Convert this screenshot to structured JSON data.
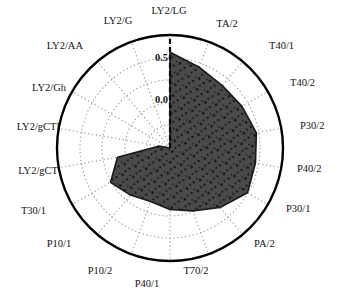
{
  "chart_data": {
    "type": "radar",
    "title": "",
    "subtitle": "",
    "xlabel": "",
    "ylabel": "",
    "grid": true,
    "legend": "none",
    "rlim": [
      -0.5,
      0.75
    ],
    "r_ticks": [
      {
        "value": 0.5,
        "label": "0.5"
      },
      {
        "value": 0.0,
        "label": "0.0"
      },
      {
        "value": -0.5,
        "label": "-0.5"
      }
    ],
    "tick_label_visible": [
      "0.5",
      "0.0"
    ],
    "outer_ring_value": 0.75,
    "start_angle_deg": 90,
    "direction": "clockwise",
    "categories": [
      "LY2/LG",
      "TA/2",
      "T40/1",
      "T40/2",
      "P30/2",
      "P40/2",
      "P30/1",
      "PA/2",
      "T70/2",
      "P40/1",
      "P10/2",
      "P10/1",
      "T30/1",
      "LY2/gCT",
      "LY2/gCTI",
      "LY2/Gh",
      "LY2/AA",
      "LY2/G"
    ],
    "series": [
      {
        "name": "series-1",
        "fill_color": "#4a4a4a",
        "line_color": "#1a1a1a",
        "values": [
          0.56,
          0.45,
          0.4,
          0.42,
          0.47,
          0.46,
          0.49,
          0.36,
          0.24,
          0.18,
          0.13,
          0.18,
          0.26,
          0.09,
          -0.38,
          -0.5,
          -0.5,
          -0.5
        ]
      }
    ]
  },
  "axes": [
    {
      "id": "axis-ly2-lg",
      "label": "LY2/LG",
      "lx": 169,
      "ly": 12,
      "anchor": "middle"
    },
    {
      "id": "axis-ta-2",
      "label": "TA/2",
      "lx": 227,
      "ly": 25,
      "anchor": "middle"
    },
    {
      "id": "axis-t40-1",
      "label": "T40/1",
      "lx": 269,
      "ly": 47,
      "anchor": "start"
    },
    {
      "id": "axis-t40-2",
      "label": "T40/2",
      "lx": 290,
      "ly": 84,
      "anchor": "start"
    },
    {
      "id": "axis-p30-2",
      "label": "P30/2",
      "lx": 300,
      "ly": 127,
      "anchor": "start"
    },
    {
      "id": "axis-p40-2",
      "label": "P40/2",
      "lx": 297,
      "ly": 170,
      "anchor": "start"
    },
    {
      "id": "axis-p30-1",
      "label": "P30/1",
      "lx": 286,
      "ly": 210,
      "anchor": "start"
    },
    {
      "id": "axis-pa-2",
      "label": "PA/2",
      "lx": 254,
      "ly": 245,
      "anchor": "start"
    },
    {
      "id": "axis-t70-2",
      "label": "T70/2",
      "lx": 196,
      "ly": 272,
      "anchor": "middle"
    },
    {
      "id": "axis-p40-1",
      "label": "P40/1",
      "lx": 147,
      "ly": 285,
      "anchor": "middle"
    },
    {
      "id": "axis-p10-2",
      "label": "P10/2",
      "lx": 100,
      "ly": 272,
      "anchor": "middle"
    },
    {
      "id": "axis-p10-1",
      "label": "P10/1",
      "lx": 59,
      "ly": 245,
      "anchor": "middle"
    },
    {
      "id": "axis-t30-1",
      "label": "T30/1",
      "lx": 46,
      "ly": 212,
      "anchor": "end"
    },
    {
      "id": "axis-ly2-gct",
      "label": "LY2/gCT",
      "lx": 58,
      "ly": 172,
      "anchor": "end"
    },
    {
      "id": "axis-ly2-gcti",
      "label": "LY2/gCTI",
      "lx": 60,
      "ly": 128,
      "anchor": "end"
    },
    {
      "id": "axis-ly2-gh",
      "label": "LY2/Gh",
      "lx": 66,
      "ly": 89,
      "anchor": "end"
    },
    {
      "id": "axis-ly2-aa",
      "label": "LY2/AA",
      "lx": 83,
      "ly": 47,
      "anchor": "end"
    },
    {
      "id": "axis-ly2-g",
      "label": "LY2/G",
      "lx": 118,
      "ly": 22,
      "anchor": "middle"
    }
  ],
  "ticks": [
    {
      "id": "tick-0-5",
      "label": "0.5",
      "tx": 168,
      "ty": 59
    },
    {
      "id": "tick-0-0",
      "label": "0.0",
      "tx": 168,
      "ty": 101
    }
  ],
  "colors": {
    "fill": "#4a4a4a",
    "outline": "#101010",
    "grid": "#9a9a9a",
    "outer_circle": "#000000",
    "text": "#111111",
    "background": "#ffffff"
  },
  "geometry": {
    "cx": 170,
    "cy": 148,
    "outer_radius": 113,
    "ring_radii": [
      113,
      90,
      68,
      45,
      23
    ]
  }
}
